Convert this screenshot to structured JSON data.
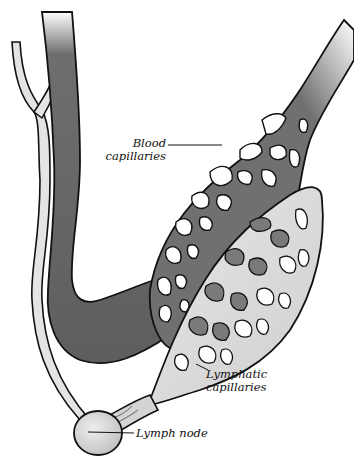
{
  "diagram": {
    "type": "anatomical-illustration",
    "labels": {
      "blood_capillaries": [
        "Blood",
        "capillaries"
      ],
      "lymphatic_capillaries": [
        "Lymphatic",
        "capillaries"
      ],
      "lymph_node": "Lymph node"
    },
    "colors": {
      "blood_vessel": "#6e6e6e",
      "blood_vessel_dark": "#555555",
      "lymph_vessel": "#d9d9d9",
      "outline": "#111111",
      "background": "#ffffff"
    }
  }
}
